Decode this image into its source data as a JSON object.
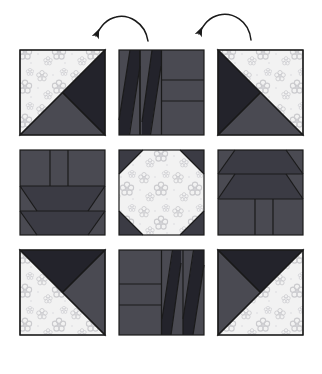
{
  "diagram": {
    "canvas": {
      "width": 322,
      "height": 374,
      "background": "#ffffff"
    },
    "grid": {
      "columns": 3,
      "rows": 3,
      "block_size": 85,
      "col_x": [
        20,
        119,
        218
      ],
      "row_y": [
        50,
        150,
        250
      ]
    },
    "palette": {
      "light_floral": "#f2f2f2",
      "floral_motif": "#c9c9cd",
      "medium_gray": "#4a4a52",
      "dark_gray": "#3b3b44",
      "darkest": "#23232b",
      "outline": "#1a1a1a",
      "background": "#ffffff"
    },
    "arrows": [
      {
        "name": "rotation-arrow-left",
        "label": "rotate",
        "direction": "counterclockwise",
        "head_at": "left",
        "start_x": 148,
        "start_y": 40,
        "end_x": 95,
        "end_y": 36,
        "peak_x": 120,
        "peak_y": 19
      },
      {
        "name": "rotation-arrow-right",
        "label": "rotate",
        "direction": "counterclockwise",
        "head_at": "left",
        "start_x": 250,
        "start_y": 40,
        "end_x": 198,
        "end_y": 34,
        "peak_x": 224,
        "peak_y": 17
      }
    ],
    "blocks": [
      {
        "name": "block-top-left",
        "position": "row1-col1",
        "type": "half-square-quarter-triangle",
        "description": "Light floral triangle upper-left, darkest triangle upper-right, medium triangle lower half",
        "rotation_deg": 0
      },
      {
        "name": "block-top-center",
        "position": "row1-col2",
        "type": "strip-parallelogram",
        "description": "Two parallelogram strips at left, three stacked rectangles at right",
        "rotation_deg": 0
      },
      {
        "name": "block-top-right",
        "position": "row1-col3",
        "type": "half-square-quarter-triangle",
        "description": "Light floral triangle upper-right, darkest triangle upper-left, medium triangle lower half",
        "rotation_deg": 270
      },
      {
        "name": "block-middle-left",
        "position": "row2-col1",
        "type": "strip-trapezoid",
        "description": "Three vertical rectangles on top, two trapezoid rows below",
        "rotation_deg": 0
      },
      {
        "name": "block-center",
        "position": "row2-col2",
        "type": "snowball-octagon",
        "description": "Light floral octagon centre with four dark corner triangles",
        "rotation_deg": 0
      },
      {
        "name": "block-middle-right",
        "position": "row2-col3",
        "type": "strip-trapezoid",
        "description": "Two trapezoid rows on top, three vertical rectangles below",
        "rotation_deg": 180
      },
      {
        "name": "block-bottom-left",
        "position": "row3-col1",
        "type": "half-square-quarter-triangle",
        "description": "Darkest triangle upper-left, medium triangle upper-right, light floral triangle lower half",
        "rotation_deg": 90
      },
      {
        "name": "block-bottom-center",
        "position": "row3-col2",
        "type": "strip-parallelogram",
        "description": "Three stacked rectangles at left, two parallelogram strips at right",
        "rotation_deg": 180
      },
      {
        "name": "block-bottom-right",
        "position": "row3-col3",
        "type": "half-square-quarter-triangle",
        "description": "Darkest triangle upper-left, medium triangle left, light floral triangle lower-right",
        "rotation_deg": 180
      }
    ]
  }
}
